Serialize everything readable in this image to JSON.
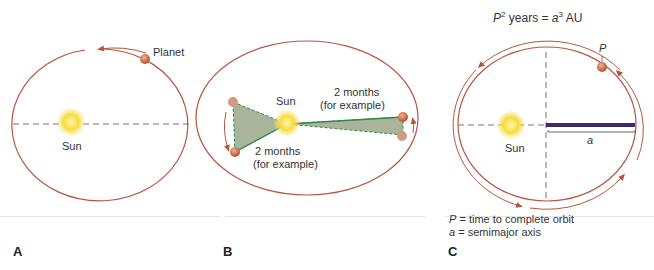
{
  "panels": [
    {
      "id": "A",
      "label": "A",
      "sun_label": "Sun",
      "planet_label": "Planet"
    },
    {
      "id": "B",
      "label": "B",
      "sun_label": "Sun",
      "area_label_right_1": "2 months",
      "area_label_right_2": "(for example)",
      "area_label_left_1": "2 months",
      "area_label_left_2": "(for example)"
    },
    {
      "id": "C",
      "label": "C",
      "sun_label": "Sun",
      "formula_P": "P",
      "formula_exp1": "2",
      "formula_years": " years = ",
      "formula_a": "a",
      "formula_exp2": "3",
      "formula_au": " AU",
      "planet_label": "P",
      "axis_label": "a",
      "legend_line1_var": "P",
      "legend_line1_text": " = time to complete orbit",
      "legend_line2_var": "a",
      "legend_line2_text": " = semimajor axis"
    }
  ],
  "colors": {
    "orbit": "#b5553e",
    "sun": "#f3d23a",
    "area_fill": "#a9b59a",
    "area_edge": "#2f8a4a",
    "axis_bar": "#3b2a6e"
  }
}
